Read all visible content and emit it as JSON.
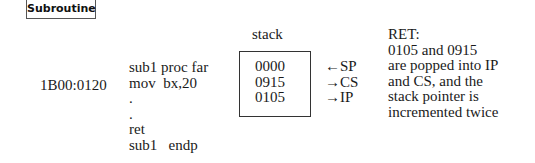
{
  "title": "Subroutine",
  "address": "1B00:0120",
  "code_lines": [
    "sub1 proc far",
    "mov  bx,20",
    ".",
    ".",
    "ret",
    "sub1   endp"
  ],
  "stack": {
    "label": "stack",
    "values": [
      "0000",
      "0915",
      "0105"
    ]
  },
  "registers": [
    {
      "arrow": "←",
      "name": "SP"
    },
    {
      "arrow": "→",
      "name": "CS"
    },
    {
      "arrow": "→",
      "name": "IP"
    }
  ],
  "note_lines": [
    "RET:",
    "0105 and 0915",
    "are popped into IP",
    "and CS, and the",
    "stack pointer is",
    "incremented twice"
  ]
}
